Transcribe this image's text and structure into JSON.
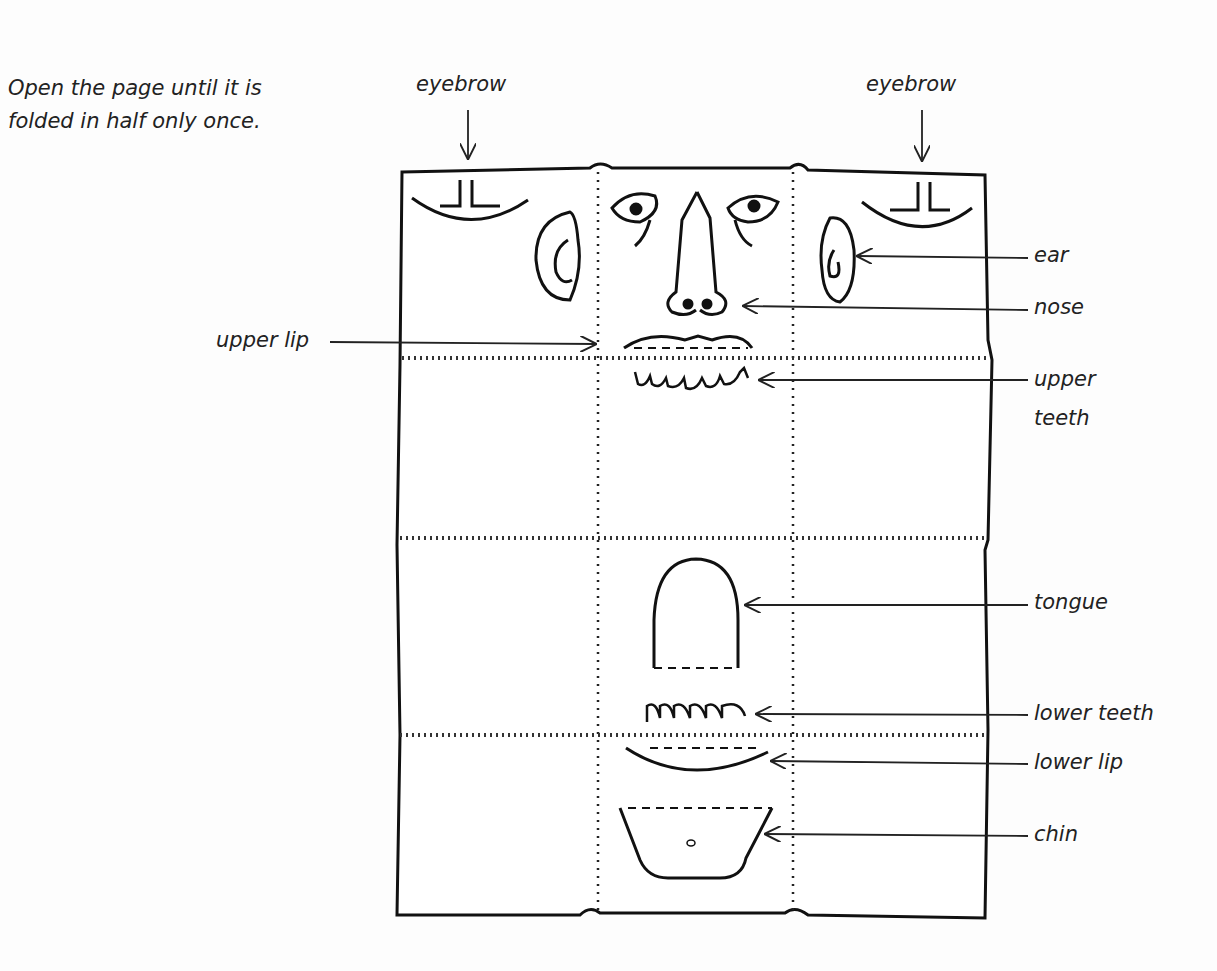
{
  "instructions": [
    "Open the page until it is",
    "folded in half only once."
  ],
  "labels": {
    "eyebrow_left": "eyebrow",
    "eyebrow_right": "eyebrow",
    "ear": "ear",
    "nose": "nose",
    "upper_lip": "upper lip",
    "upper_teeth_1": "upper",
    "upper_teeth_2": "teeth",
    "tongue": "tongue",
    "lower_teeth": "lower teeth",
    "lower_lip": "lower lip",
    "chin": "chin"
  }
}
